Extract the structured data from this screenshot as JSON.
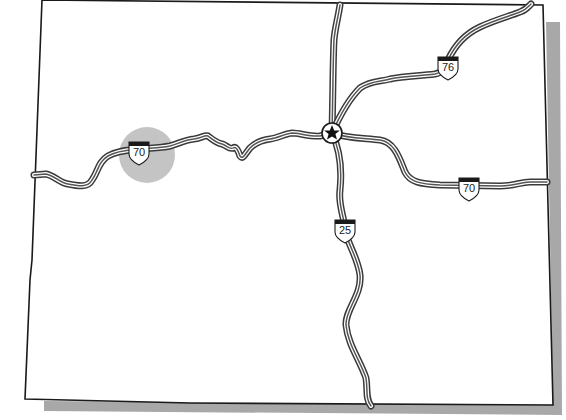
{
  "map": {
    "type": "state-outline-highway-map",
    "colors": {
      "outline": "#1a1a1a",
      "shadow": "#a8a8a8",
      "road": "#3a3a3a",
      "highlight_circle": "#c4c4c4",
      "background": "#ffffff"
    },
    "capital": {
      "icon": "star-icon",
      "x": 332,
      "y": 133
    },
    "highlight": {
      "x": 147,
      "y": 155,
      "r": 28
    },
    "shields": [
      {
        "id": "i70-west",
        "label": "70",
        "x": 139,
        "y": 151
      },
      {
        "id": "i76",
        "label": "76",
        "x": 448,
        "y": 66
      },
      {
        "id": "i70-east",
        "label": "70",
        "x": 469,
        "y": 187
      },
      {
        "id": "i25",
        "label": "25",
        "x": 345,
        "y": 229
      }
    ],
    "highways": [
      "I-70",
      "I-76",
      "I-25"
    ]
  }
}
